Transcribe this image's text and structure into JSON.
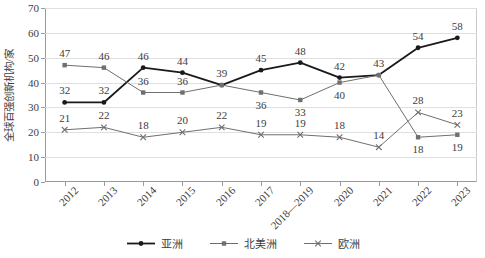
{
  "chart_data": {
    "type": "line",
    "title": "",
    "xlabel": "",
    "ylabel": "全球百强创新机构/家",
    "ylim": [
      0,
      70
    ],
    "ytick_step": 10,
    "yticks": [
      0,
      10,
      20,
      30,
      40,
      50,
      60,
      70
    ],
    "grid": true,
    "legend_position": "bottom",
    "categories": [
      "2012",
      "2013",
      "2014",
      "2015",
      "2016",
      "2017",
      "2018—2019",
      "2020",
      "2021",
      "2022",
      "2023"
    ],
    "series": [
      {
        "name": "亚洲",
        "marker": "filled-circle",
        "color": "#1a1a1a",
        "line_width": 1.8,
        "values": [
          32,
          32,
          46,
          44,
          39,
          45,
          48,
          42,
          43,
          54,
          58
        ]
      },
      {
        "name": "北美洲",
        "marker": "filled-square",
        "color": "#6f6f6f",
        "line_width": 1.0,
        "values": [
          47,
          46,
          36,
          36,
          39,
          36,
          33,
          40,
          43,
          18,
          19
        ]
      },
      {
        "name": "欧洲",
        "marker": "cross",
        "color": "#6f6f6f",
        "line_width": 1.0,
        "values": [
          21,
          22,
          18,
          20,
          22,
          19,
          19,
          18,
          14,
          28,
          23
        ]
      }
    ],
    "data_labels": [
      {
        "series": "亚洲",
        "index": 0,
        "text": "32",
        "dx": 0,
        "dy": -12
      },
      {
        "series": "亚洲",
        "index": 1,
        "text": "32",
        "dx": 0,
        "dy": -12
      },
      {
        "series": "亚洲",
        "index": 2,
        "text": "46",
        "dx": 0,
        "dy": -12
      },
      {
        "series": "亚洲",
        "index": 3,
        "text": "44",
        "dx": 0,
        "dy": -12
      },
      {
        "series": "亚洲",
        "index": 4,
        "text": "39",
        "dx": 0,
        "dy": -12
      },
      {
        "series": "亚洲",
        "index": 5,
        "text": "45",
        "dx": 0,
        "dy": -12
      },
      {
        "series": "亚洲",
        "index": 6,
        "text": "48",
        "dx": 0,
        "dy": -12
      },
      {
        "series": "亚洲",
        "index": 7,
        "text": "42",
        "dx": 0,
        "dy": -12
      },
      {
        "series": "亚洲",
        "index": 8,
        "text": "43",
        "dx": 0,
        "dy": -12
      },
      {
        "series": "亚洲",
        "index": 9,
        "text": "54",
        "dx": 0,
        "dy": -12
      },
      {
        "series": "亚洲",
        "index": 10,
        "text": "58",
        "dx": 0,
        "dy": -12
      },
      {
        "series": "北美洲",
        "index": 0,
        "text": "47",
        "dx": 0,
        "dy": -12
      },
      {
        "series": "北美洲",
        "index": 1,
        "text": "46",
        "dx": 0,
        "dy": -12
      },
      {
        "series": "北美洲",
        "index": 2,
        "text": "36",
        "dx": 0,
        "dy": -12
      },
      {
        "series": "北美洲",
        "index": 3,
        "text": "36",
        "dx": 0,
        "dy": -12
      },
      {
        "series": "北美洲",
        "index": 5,
        "text": "36",
        "dx": 0,
        "dy": 12
      },
      {
        "series": "北美洲",
        "index": 6,
        "text": "33",
        "dx": 0,
        "dy": 12
      },
      {
        "series": "北美洲",
        "index": 7,
        "text": "40",
        "dx": 0,
        "dy": 12
      },
      {
        "series": "北美洲",
        "index": 9,
        "text": "18",
        "dx": 0,
        "dy": 12
      },
      {
        "series": "北美洲",
        "index": 10,
        "text": "19",
        "dx": 0,
        "dy": 12
      },
      {
        "series": "欧洲",
        "index": 0,
        "text": "21",
        "dx": 0,
        "dy": -12
      },
      {
        "series": "欧洲",
        "index": 1,
        "text": "22",
        "dx": 0,
        "dy": -12
      },
      {
        "series": "欧洲",
        "index": 2,
        "text": "18",
        "dx": 0,
        "dy": -12
      },
      {
        "series": "欧洲",
        "index": 3,
        "text": "20",
        "dx": 0,
        "dy": -12
      },
      {
        "series": "欧洲",
        "index": 4,
        "text": "22",
        "dx": 0,
        "dy": -12
      },
      {
        "series": "欧洲",
        "index": 5,
        "text": "19",
        "dx": 0,
        "dy": -12
      },
      {
        "series": "欧洲",
        "index": 6,
        "text": "19",
        "dx": 0,
        "dy": -12
      },
      {
        "series": "欧洲",
        "index": 7,
        "text": "18",
        "dx": 0,
        "dy": -12
      },
      {
        "series": "欧洲",
        "index": 8,
        "text": "14",
        "dx": 0,
        "dy": -12
      },
      {
        "series": "欧洲",
        "index": 9,
        "text": "28",
        "dx": 0,
        "dy": -12
      },
      {
        "series": "欧洲",
        "index": 10,
        "text": "23",
        "dx": 0,
        "dy": -12
      }
    ]
  }
}
